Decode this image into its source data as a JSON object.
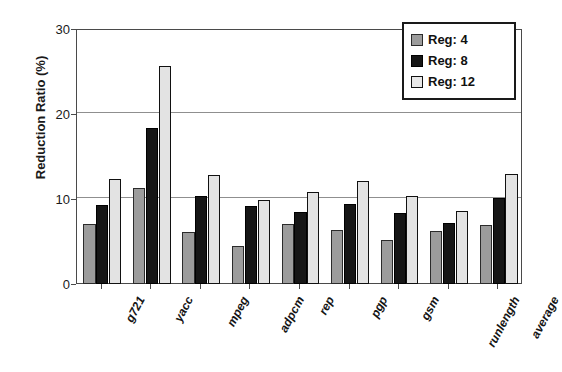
{
  "chart_data": {
    "type": "bar",
    "title": "",
    "xlabel": "",
    "ylabel": "Reduction Ratio (%)",
    "categories": [
      "g721",
      "yacc",
      "mpeg",
      "adpcm",
      "rep",
      "pgp",
      "gsm",
      "runlength",
      "average"
    ],
    "series": [
      {
        "name": "Reg: 4",
        "color": "#9c9c9c",
        "values": [
          7.1,
          11.3,
          6.1,
          4.5,
          7.1,
          6.3,
          5.2,
          6.2,
          6.9
        ]
      },
      {
        "name": "Reg: 8",
        "color": "#161616",
        "values": [
          9.3,
          18.3,
          10.3,
          9.2,
          8.5,
          9.4,
          8.4,
          7.2,
          10.1
        ]
      },
      {
        "name": "Reg: 12",
        "color": "#e3e3e3",
        "values": [
          12.3,
          25.6,
          12.8,
          9.9,
          10.8,
          12.1,
          10.4,
          8.6,
          12.9
        ]
      }
    ],
    "ylim": [
      0,
      30
    ],
    "yticks": [
      0,
      10,
      20,
      30
    ],
    "ytick_labels": [
      "0",
      "10",
      "20",
      "30"
    ],
    "grid": true,
    "grid_axis": "y",
    "legend_position": "top-right",
    "xtick_rotation": -62
  },
  "legend": {
    "entries": [
      {
        "label": "Reg: 4"
      },
      {
        "label": "Reg: 8"
      },
      {
        "label": "Reg: 12"
      }
    ]
  }
}
